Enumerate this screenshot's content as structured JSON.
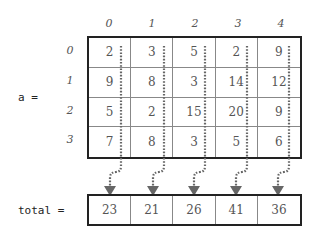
{
  "labels": {
    "matrix_name": "a =",
    "total_name": "total ="
  },
  "columns": [
    "0",
    "1",
    "2",
    "3",
    "4"
  ],
  "rows": [
    "0",
    "1",
    "2",
    "3"
  ],
  "matrix": [
    [
      "2",
      "3",
      "5",
      "2",
      "9"
    ],
    [
      "9",
      "8",
      "3",
      "14",
      "12"
    ],
    [
      "5",
      "2",
      "15",
      "20",
      "9"
    ],
    [
      "7",
      "8",
      "3",
      "5",
      "6"
    ]
  ],
  "totals": [
    "23",
    "21",
    "26",
    "41",
    "36"
  ],
  "colors": {
    "border": "#222222",
    "arrow": "#666666"
  }
}
